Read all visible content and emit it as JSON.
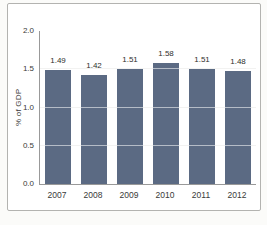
{
  "page": {
    "background_color": "#fbfbf9"
  },
  "card": {
    "background_color": "#ffffff",
    "border_color": "#b3b3b0"
  },
  "chart_data": {
    "type": "bar",
    "title": "",
    "categories": [
      "2007",
      "2008",
      "2009",
      "2010",
      "2011",
      "2012"
    ],
    "values": [
      1.49,
      1.42,
      1.51,
      1.58,
      1.51,
      1.48
    ],
    "value_labels": [
      "1.49",
      "1.42",
      "1.51",
      "1.58",
      "1.51",
      "1.48"
    ],
    "xlabel": "",
    "ylabel": "% of GDP",
    "ylim": [
      0.0,
      2.0
    ],
    "yticks": [
      0.0,
      0.5,
      1.0,
      1.5,
      2.0
    ],
    "ytick_labels": [
      "0.0",
      "0.5",
      "1.0",
      "1.5",
      "2.0"
    ],
    "gridline_values": [
      0.5,
      1.0,
      1.5
    ],
    "grid": "horizontal",
    "legend": "none",
    "bar_color": "#5b6a83",
    "gridline_color": "#e3e3e1",
    "gridline_over_bar_color": "rgba(255,255,255,0.55)",
    "axis_color": "#999999",
    "text_color": "#3a3a38"
  }
}
